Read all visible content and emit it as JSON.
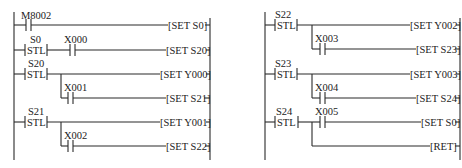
{
  "diagram": {
    "type": "ladder",
    "left": {
      "rails": {
        "left_x": 14,
        "right_x": 210,
        "top": 12,
        "bottom": 160
      },
      "rungs": [
        {
          "y": 25,
          "elements": [
            {
              "kind": "contact",
              "label": "M8002",
              "x": 28
            }
          ],
          "coil": "[SET S0]"
        },
        {
          "y": 50,
          "elements": [
            {
              "kind": "stl",
              "label": "S0",
              "tag": "STL",
              "x": 26
            },
            {
              "kind": "contact",
              "label": "X000",
              "x": 73
            }
          ],
          "coil": "[SET S20]"
        },
        {
          "y": 74,
          "elements": [
            {
              "kind": "stl",
              "label": "S20",
              "tag": "STL",
              "x": 26
            }
          ],
          "coil": "[SET Y000]"
        },
        {
          "y": 98,
          "branch_from_x": 61,
          "branch_from_y": 74,
          "elements": [
            {
              "kind": "contact",
              "label": "X001",
              "x": 70
            }
          ],
          "coil": "[SET S21]"
        },
        {
          "y": 122,
          "elements": [
            {
              "kind": "stl",
              "label": "S21",
              "tag": "STL",
              "x": 26
            }
          ],
          "coil": "[SET Y001]"
        },
        {
          "y": 146,
          "branch_from_x": 61,
          "branch_from_y": 122,
          "elements": [
            {
              "kind": "contact",
              "label": "X002",
              "x": 70
            }
          ],
          "coil": "[SET S22]"
        }
      ]
    },
    "right": {
      "rails": {
        "left_x": 265,
        "right_x": 460,
        "top": 12,
        "bottom": 160
      },
      "rungs": [
        {
          "y": 25,
          "elements": [
            {
              "kind": "stl",
              "label": "S22",
              "tag": "STL",
              "x": 276
            }
          ],
          "coil": "[SET Y002]"
        },
        {
          "y": 49,
          "branch_from_x": 312,
          "branch_from_y": 25,
          "elements": [
            {
              "kind": "contact",
              "label": "X003",
              "x": 320
            }
          ],
          "coil": "[SET S23]"
        },
        {
          "y": 74,
          "elements": [
            {
              "kind": "stl",
              "label": "S23",
              "tag": "STL",
              "x": 276
            }
          ],
          "coil": "[SET Y003]"
        },
        {
          "y": 98,
          "branch_from_x": 312,
          "branch_from_y": 74,
          "elements": [
            {
              "kind": "contact",
              "label": "X004",
              "x": 320
            }
          ],
          "coil": "[SET S24]"
        },
        {
          "y": 122,
          "elements": [
            {
              "kind": "stl",
              "label": "S24",
              "tag": "STL",
              "x": 276
            },
            {
              "kind": "contact",
              "label": "X005",
              "x": 320
            }
          ],
          "coil": "[SET S0]"
        },
        {
          "y": 146,
          "branch_from_x": 312,
          "branch_from_y": 122,
          "elements": [],
          "coil": "[RET]"
        }
      ]
    }
  },
  "labels": {
    "m8002": "M8002",
    "s0": "S0",
    "x000": "X000",
    "s20": "S20",
    "x001": "X001",
    "s21": "S21",
    "x002": "X002",
    "s22": "S22",
    "x003": "X003",
    "s23": "S23",
    "x004": "X004",
    "s24": "S24",
    "x005": "X005",
    "stl": "STL",
    "set_s0": "[SET S0]",
    "set_s20": "[SET S20]",
    "set_y000": "[SET Y000]",
    "set_s21": "[SET S21]",
    "set_y001": "[SET Y001]",
    "set_s22": "[SET S22]",
    "set_y002": "[SET Y002]",
    "set_s23": "[SET S23]",
    "set_y003": "[SET Y003]",
    "set_s24": "[SET S24]",
    "set_s0_b": "[SET S0]",
    "ret": "[RET]"
  }
}
